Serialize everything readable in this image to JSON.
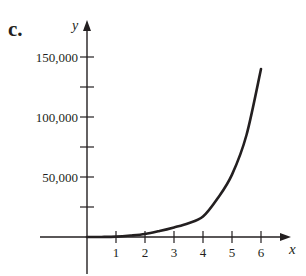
{
  "figure": {
    "part_label": "c."
  },
  "chart_data": {
    "type": "line",
    "title": "",
    "xlabel": "x",
    "ylabel": "y",
    "x_ticks": [
      1,
      2,
      3,
      4,
      5,
      6
    ],
    "x_tick_labels": [
      "1",
      "2",
      "3",
      "4",
      "5",
      "6"
    ],
    "y_ticks": [
      25000,
      50000,
      75000,
      100000,
      125000,
      150000
    ],
    "y_tick_labels": [
      "",
      "50,000",
      "",
      "100,000",
      "",
      "150,000"
    ],
    "xlim": [
      -1.5,
      7
    ],
    "ylim": [
      -35000,
      165000
    ],
    "grid": false,
    "legend": null,
    "series": [
      {
        "name": "curve",
        "x": [
          0,
          0.5,
          1,
          1.5,
          2,
          2.5,
          3,
          3.5,
          4,
          4.5,
          5,
          5.5,
          6
        ],
        "y": [
          0,
          50,
          300,
          1200,
          2500,
          5000,
          8000,
          11500,
          17000,
          32000,
          52000,
          85000,
          140000
        ]
      }
    ]
  },
  "colors": {
    "ink": "#231f20",
    "background": "#ffffff"
  }
}
